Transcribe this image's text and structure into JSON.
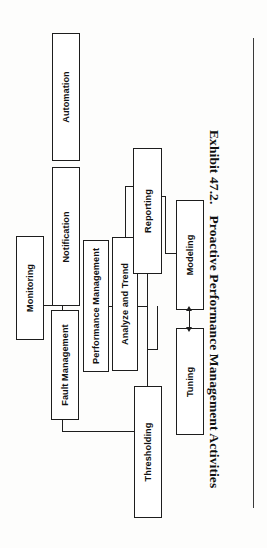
{
  "document": {
    "caption_number": "Exhibit 47.2.",
    "caption_title": "Proactive Performance Management Activities"
  },
  "diagram": {
    "type": "hierarchy-tree",
    "orientation": "page rotated 90 degrees counter-clockwise",
    "root": "Monitoring",
    "nodes": [
      {
        "id": "monitoring",
        "label": "Monitoring"
      },
      {
        "id": "notification",
        "label": "Notification"
      },
      {
        "id": "automation",
        "label": "Automation"
      },
      {
        "id": "fault-management",
        "label": "Fault Management"
      },
      {
        "id": "performance-management",
        "label": "Performance Management"
      },
      {
        "id": "analyze-and-trend",
        "label": "Analyze and Trend"
      },
      {
        "id": "reporting",
        "label": "Reporting"
      },
      {
        "id": "modeling",
        "label": "Modeling"
      },
      {
        "id": "tuning",
        "label": "Tuning"
      },
      {
        "id": "thresholding",
        "label": "Thresholding"
      }
    ],
    "edges": [
      {
        "from": "monitoring",
        "to": "notification",
        "style": "line"
      },
      {
        "from": "monitoring",
        "to": "fault-management",
        "style": "line"
      },
      {
        "from": "notification",
        "to": "automation",
        "style": "line"
      },
      {
        "from": "fault-management",
        "to": "performance-management",
        "style": "line"
      },
      {
        "from": "fault-management",
        "to": "thresholding",
        "style": "line"
      },
      {
        "from": "performance-mgmt",
        "to": "analyze-and-trend",
        "style": "line"
      },
      {
        "from": "analyze-and-trend",
        "to": "reporting",
        "style": "line"
      },
      {
        "from": "analyze-and-trend",
        "to": "modeling",
        "style": "line"
      },
      {
        "from": "analyze-and-trend",
        "to": "tuning",
        "style": "line"
      },
      {
        "from": "modeling",
        "to": "tuning",
        "style": "double-arrow"
      }
    ]
  }
}
